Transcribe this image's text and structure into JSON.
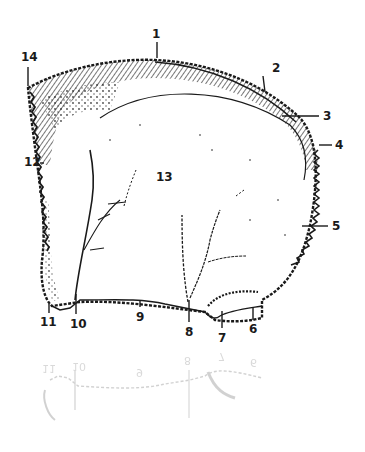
{
  "diagram": {
    "ink_color": "#1a1a1a",
    "background": "#ffffff",
    "central_label": "13",
    "labels": [
      {
        "id": "1",
        "x": 156,
        "y": 28
      },
      {
        "id": "2",
        "x": 276,
        "y": 62
      },
      {
        "id": "3",
        "x": 324,
        "y": 110
      },
      {
        "id": "4",
        "x": 335,
        "y": 139
      },
      {
        "id": "5",
        "x": 332,
        "y": 220
      },
      {
        "id": "6",
        "x": 249,
        "y": 323
      },
      {
        "id": "7",
        "x": 219,
        "y": 332
      },
      {
        "id": "8",
        "x": 185,
        "y": 326
      },
      {
        "id": "9",
        "x": 136,
        "y": 311
      },
      {
        "id": "10",
        "x": 72,
        "y": 318
      },
      {
        "id": "11",
        "x": 40,
        "y": 316
      },
      {
        "id": "12",
        "x": 24,
        "y": 156
      },
      {
        "id": "13",
        "x": 156,
        "y": 171
      },
      {
        "id": "14",
        "x": 21,
        "y": 51
      }
    ],
    "reflection_labels": [
      "11",
      "10",
      "9",
      "8",
      "7",
      "6"
    ]
  }
}
